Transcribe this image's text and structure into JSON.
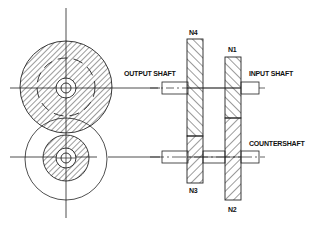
{
  "diagram": {
    "labels": {
      "n4": "N4",
      "n1": "N1",
      "n3": "N3",
      "n2": "N2",
      "output_shaft": "OUTPUT SHAFT",
      "input_shaft": "INPUT SHAFT",
      "countershaft": "COUNTERSHAFT"
    },
    "colors": {
      "line": "#222222",
      "background": "#ffffff"
    }
  }
}
